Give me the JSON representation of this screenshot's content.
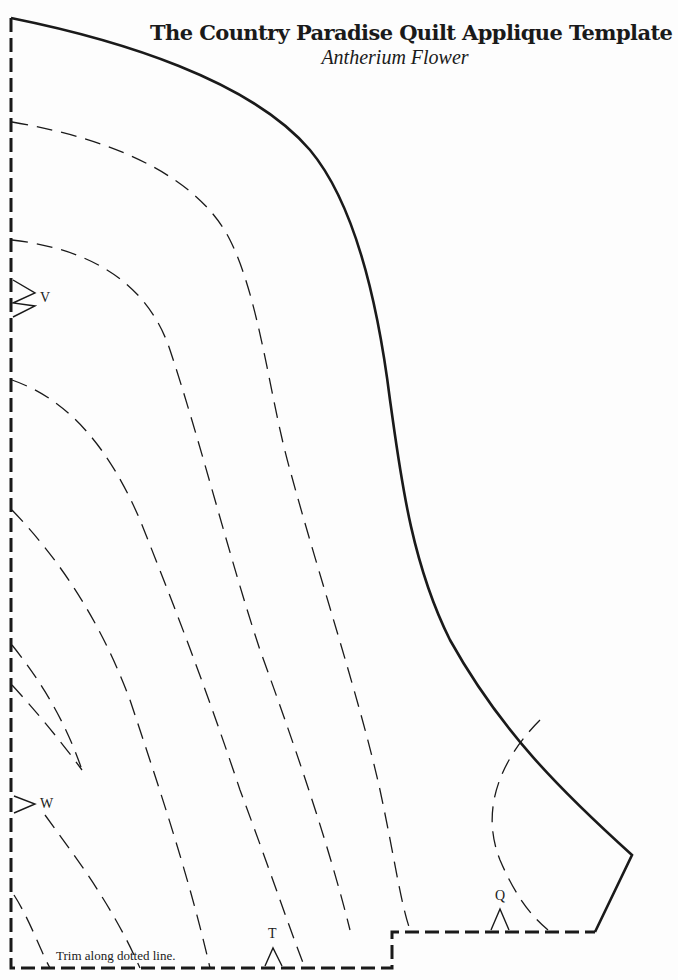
{
  "document": {
    "title": "The Country Paradise Quilt Applique Template",
    "subtitle": "Antherium Flower"
  },
  "markers": {
    "v": "V",
    "w": "W",
    "t": "T",
    "q": "Q"
  },
  "instructions": {
    "trim": "Trim along dotted line."
  },
  "colors": {
    "ink": "#1a1a1a",
    "paper": "#fdfdfd"
  }
}
